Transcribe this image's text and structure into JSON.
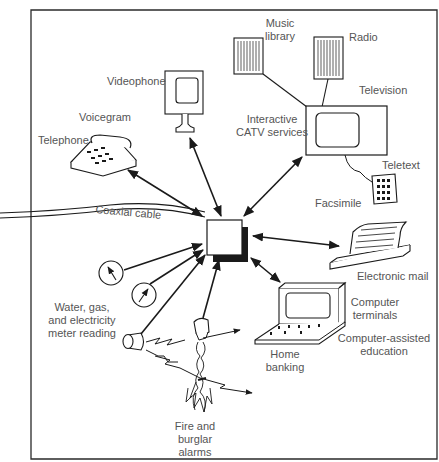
{
  "diagram": {
    "title": "",
    "colors": {
      "line": "#1a1a1a",
      "text": "#555555",
      "background": "#ffffff"
    },
    "hub": {
      "label": "",
      "shape": "square-with-shadow"
    },
    "nodes": [
      {
        "id": "music-library",
        "label_line1": "Music",
        "label_line2": "library",
        "icon": "speaker-icon"
      },
      {
        "id": "radio",
        "label": "Radio",
        "icon": "speaker-icon"
      },
      {
        "id": "television",
        "label": "Television",
        "icon": "tv-icon"
      },
      {
        "id": "interactive-catv",
        "label_line1": "Interactive",
        "label_line2": "CATV services"
      },
      {
        "id": "teletext",
        "label": "Teletext",
        "icon": "keypad-icon"
      },
      {
        "id": "videophone",
        "label": "Videophone",
        "icon": "videophone-icon"
      },
      {
        "id": "voicegram",
        "label": "Voicegram"
      },
      {
        "id": "telephone",
        "label": "Telephone",
        "icon": "telephone-icon"
      },
      {
        "id": "coaxial-cable",
        "label": "Coaxial cable"
      },
      {
        "id": "facsimile",
        "label": "Facsimile"
      },
      {
        "id": "electronic-mail",
        "label": "Electronic mail",
        "icon": "printer-icon"
      },
      {
        "id": "computer-terminals",
        "label_line1": "Computer",
        "label_line2": "terminals",
        "icon": "computer-terminal-icon"
      },
      {
        "id": "computer-assisted-education",
        "label_line1": "Computer-assisted",
        "label_line2": "education"
      },
      {
        "id": "home-banking",
        "label_line1": "Home",
        "label_line2": "banking"
      },
      {
        "id": "meter-reading",
        "label_line1": "Water, gas,",
        "label_line2": "and electricity",
        "label_line3": "meter reading",
        "icon": "meter-gauge-icon"
      },
      {
        "id": "fire-burglar-alarms",
        "label_line1": "Fire and",
        "label_line2": "burglar",
        "label_line3": "alarms",
        "icon": "fire-alarm-icon"
      }
    ],
    "edges": [
      {
        "from": "hub",
        "to": "telephone",
        "type": "bidirectional"
      },
      {
        "from": "hub",
        "to": "videophone",
        "type": "bidirectional"
      },
      {
        "from": "hub",
        "to": "television",
        "type": "bidirectional"
      },
      {
        "from": "hub",
        "to": "electronic-mail",
        "type": "bidirectional"
      },
      {
        "from": "hub",
        "to": "computer-terminals",
        "type": "bidirectional"
      },
      {
        "from": "meter-reading",
        "to": "hub",
        "type": "directed"
      },
      {
        "from": "fire-burglar-alarms",
        "to": "hub",
        "type": "directed"
      },
      {
        "from": "music-library",
        "to": "television",
        "type": "line"
      },
      {
        "from": "radio",
        "to": "television",
        "type": "line"
      },
      {
        "from": "television",
        "to": "teletext",
        "type": "cord"
      },
      {
        "from": "coaxial-cable",
        "to": "hub",
        "type": "cable"
      }
    ]
  }
}
